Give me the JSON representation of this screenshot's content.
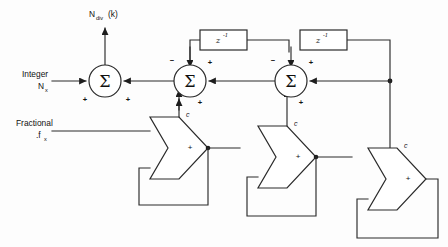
{
  "diagram": {
    "background_color": "#fdfdfd",
    "line_color": "#2a2a2a"
  },
  "labels": {
    "output": "N",
    "output_sub": "div",
    "output_paren": "(k)",
    "integer": "Integer",
    "integer_sym": "N",
    "integer_sub": "x",
    "fractional": "Fractional",
    "fractional_sym": ".f",
    "fractional_sub": "x"
  },
  "adders": [
    {
      "id": "adder-1",
      "symbol": "Σ",
      "cx": 105,
      "cy": 81,
      "r": 16,
      "signs": [
        {
          "text": "+",
          "x": 85,
          "y": 100
        },
        {
          "text": "+",
          "x": 128,
          "y": 100
        }
      ]
    },
    {
      "id": "adder-2",
      "symbol": "Σ",
      "cx": 190,
      "cy": 81,
      "r": 16,
      "signs": [
        {
          "text": "−",
          "x": 172,
          "y": 61
        },
        {
          "text": "+",
          "x": 210,
          "y": 63
        },
        {
          "text": "+",
          "x": 200,
          "y": 103
        }
      ]
    },
    {
      "id": "adder-3",
      "symbol": "Σ",
      "cx": 291,
      "cy": 81,
      "r": 16,
      "signs": [
        {
          "text": "−",
          "x": 273,
          "y": 61
        },
        {
          "text": "+",
          "x": 311,
          "y": 63
        },
        {
          "text": "+",
          "x": 301,
          "y": 103
        }
      ]
    }
  ],
  "delays": [
    {
      "id": "delay-1",
      "base": "z",
      "exponent": "-1",
      "x": 200,
      "y": 30,
      "w": 47,
      "h": 20
    },
    {
      "id": "delay-2",
      "base": "z",
      "exponent": "-1",
      "x": 300,
      "y": 30,
      "w": 47,
      "h": 20
    }
  ],
  "comparators": [
    {
      "id": "comparator-1",
      "c_label": "c",
      "plus": "+",
      "x": 150,
      "y": 117,
      "w": 58,
      "h": 62
    },
    {
      "id": "comparator-2",
      "c_label": "c",
      "plus": "+",
      "x": 258,
      "y": 126,
      "w": 58,
      "h": 62
    },
    {
      "id": "comparator-3",
      "c_label": "c",
      "plus": "+",
      "x": 368,
      "y": 148,
      "w": 58,
      "h": 62
    }
  ]
}
